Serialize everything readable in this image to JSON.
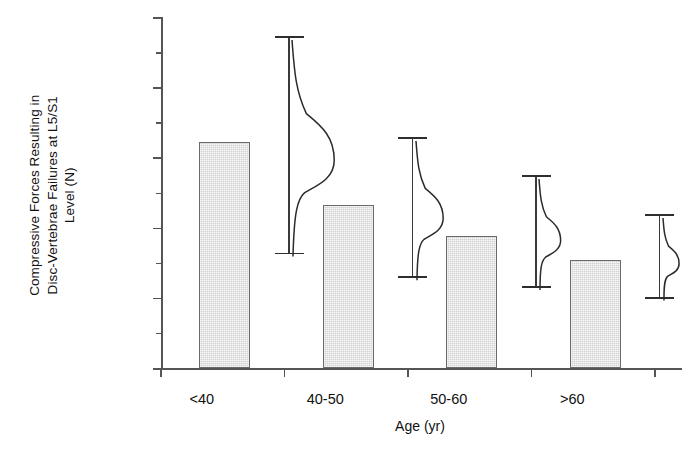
{
  "chart_data": {
    "type": "bar",
    "title": "",
    "xlabel": "Age (yr)",
    "ylabel": "Compressive Forces Resulting in\nDisc-Vertebrae Failures at L5/S1\nLevel (N)",
    "categories": [
      "<40",
      "40-50",
      "50-60",
      ">60"
    ],
    "values": [
      6440,
      4650,
      3770,
      3080
    ],
    "series": [
      {
        "name": "Compressive force at failure",
        "values": [
          6440,
          4650,
          3770,
          3080
        ],
        "error_upper": [
          9460,
          6590,
          5500,
          4380
        ],
        "error_lower": [
          3290,
          2620,
          2340,
          2030
        ]
      }
    ],
    "ylim": [
      0,
      10000
    ],
    "ytick_labels": [
      "0",
      "2000",
      "4000",
      "6000",
      "8000",
      "10000"
    ],
    "ytick_values": [
      0,
      2000,
      4000,
      6000,
      8000,
      10000
    ],
    "yminor_values": [
      1000,
      3000,
      5000,
      7000,
      9000
    ],
    "grid": false,
    "legend": "none",
    "annotations": [
      "Half-violin distribution curve drawn beside each error bar",
      "Error bars show range (min–max) of distribution"
    ],
    "bar_fill_color": "#d2d2d2",
    "bar_edge_color": "#6a6a6a",
    "axis_color": "#555555",
    "error_bar_color": "#2e2e2e"
  },
  "axis": {
    "y_title_line1": "Compressive Forces Resulting in",
    "y_title_line2": "Disc-Vertebrae Failures at L5/S1",
    "y_title_line3": "Level (N)",
    "x_title": "Age (yr)"
  },
  "ticks": {
    "y": [
      {
        "label": "10000",
        "value": 10000
      },
      {
        "label": "8000",
        "value": 8000
      },
      {
        "label": "6000",
        "value": 6000
      },
      {
        "label": "4000",
        "value": 4000
      },
      {
        "label": "2000",
        "value": 2000
      },
      {
        "label": "0",
        "value": 0
      }
    ],
    "x": [
      {
        "label": "<40"
      },
      {
        "label": "40-50"
      },
      {
        "label": "50-60"
      },
      {
        "label": ">60"
      }
    ]
  }
}
